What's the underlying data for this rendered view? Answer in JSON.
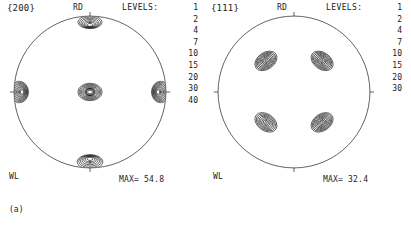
{
  "figure": {
    "background": "#ffffff",
    "line_color": "#1a1a1a",
    "panels": [
      {
        "id": "a",
        "caption": "(a)",
        "plane_label": "{200}",
        "rd_label": "RD",
        "wl_label": "WL",
        "levels_label": "LEVELS:",
        "levels": [
          "1",
          "2",
          "4",
          "7",
          "10",
          "15",
          "20",
          "30",
          "40"
        ],
        "max_label": "MAX= 54.8"
      },
      {
        "id": "b",
        "caption": "(b)",
        "plane_label": "{111}",
        "rd_label": "RD",
        "wl_label": "WL",
        "levels_label": "LEVELS:",
        "levels": [
          "1",
          "2",
          "4",
          "7",
          "10",
          "15",
          "20",
          "30"
        ],
        "max_label": "MAX= 32.4"
      }
    ]
  },
  "chart_data": {
    "type": "contour",
    "projection": "stereographic",
    "subplots": [
      {
        "label": "(a)",
        "plane": "{200}",
        "reference_directions": {
          "top": "RD",
          "bottom_left": "WL"
        },
        "contour_levels": [
          1,
          2,
          4,
          7,
          10,
          15,
          20,
          30,
          40
        ],
        "max_intensity": 54.8,
        "intensity_units": "times random",
        "poles": [
          {
            "name": "center",
            "cx": 0.0,
            "cy": 0.0,
            "peak": 54.8,
            "shape": "ring",
            "rx": 0.16,
            "ry": 0.115
          },
          {
            "name": "east-edge",
            "cx": 0.93,
            "cy": 0.0,
            "peak": 44.0,
            "shape": "arc-lobe",
            "rx": 0.12,
            "ry": 0.135
          },
          {
            "name": "west-edge",
            "cx": -0.93,
            "cy": 0.0,
            "peak": 42.0,
            "shape": "arc-lobe",
            "rx": 0.12,
            "ry": 0.135
          },
          {
            "name": "north-edge",
            "cx": 0.0,
            "cy": 0.92,
            "peak": 22.0,
            "shape": "cap-lobe",
            "rx": 0.145,
            "ry": 0.085
          },
          {
            "name": "south-edge",
            "cx": 0.0,
            "cy": -0.92,
            "peak": 24.0,
            "shape": "cap-lobe",
            "rx": 0.155,
            "ry": 0.095
          }
        ]
      },
      {
        "label": "(b)",
        "plane": "{111}",
        "reference_directions": {
          "top": "RD",
          "bottom_left": "WL"
        },
        "contour_levels": [
          1,
          2,
          4,
          7,
          10,
          15,
          20,
          30
        ],
        "max_intensity": 32.4,
        "intensity_units": "times random",
        "poles": [
          {
            "name": "upper-left",
            "cx": -0.37,
            "cy": 0.41,
            "peak": 32.4,
            "shape": "ellipse",
            "rx": 0.16,
            "ry": 0.11,
            "rot": -35
          },
          {
            "name": "upper-right",
            "cx": 0.37,
            "cy": 0.41,
            "peak": 31.0,
            "shape": "ellipse",
            "rx": 0.16,
            "ry": 0.11,
            "rot": 35
          },
          {
            "name": "lower-left",
            "cx": -0.37,
            "cy": -0.4,
            "peak": 30.0,
            "shape": "ellipse",
            "rx": 0.16,
            "ry": 0.11,
            "rot": 35
          },
          {
            "name": "lower-right",
            "cx": 0.37,
            "cy": -0.4,
            "peak": 30.5,
            "shape": "ellipse",
            "rx": 0.16,
            "ry": 0.11,
            "rot": -35
          }
        ]
      }
    ],
    "xlabel": "",
    "ylabel": "",
    "grid": false,
    "legend": "levels list at right of each circle"
  }
}
